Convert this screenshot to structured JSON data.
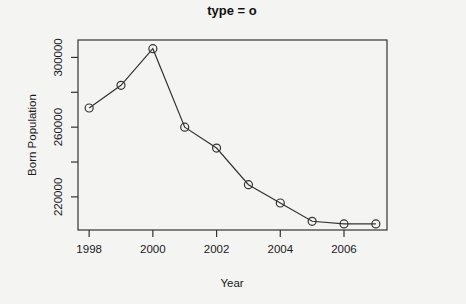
{
  "chart_data": {
    "type": "line",
    "title": "type = o",
    "xlabel": "Year",
    "ylabel": "Born Population",
    "x": [
      1998,
      1999,
      2000,
      2001,
      2002,
      2003,
      2004,
      2005,
      2006,
      2007
    ],
    "series": [
      {
        "name": "Born Population",
        "values": [
          271000,
          284000,
          305000,
          260000,
          248000,
          227000,
          216500,
          206000,
          204500,
          204500
        ],
        "marker": "open-circle",
        "line": true
      }
    ],
    "xticks": [
      1998,
      2000,
      2002,
      2004,
      2006
    ],
    "xtick_labels": [
      "1998",
      "2000",
      "2002",
      "2004",
      "2006"
    ],
    "yticks": [
      220000,
      240000,
      260000,
      280000,
      300000
    ],
    "ytick_labels": [
      "220000",
      "",
      "260000",
      "",
      "300000"
    ],
    "xlim": [
      1997.65,
      2007.35
    ],
    "ylim": [
      201000,
      310000
    ],
    "grid": false,
    "legend": null,
    "colors": {
      "line": "#333333",
      "background": "#f4f4f3"
    }
  }
}
